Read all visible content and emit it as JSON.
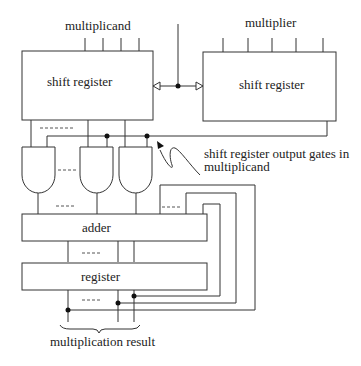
{
  "diagram": {
    "type": "block-diagram",
    "title": "",
    "labels": {
      "multiplicand_input": "multiplicand",
      "multiplier_input": "multiplier",
      "multiplicand_register": "shift register",
      "multiplier_register": "shift register",
      "annotation_line1": "shift register output gates in",
      "annotation_line2": "multiplicand",
      "adder": "adder",
      "register": "register",
      "result": "multiplication result",
      "ellipsis": "----"
    },
    "components": [
      {
        "id": "multiplicand-shift-register",
        "label": "shift register",
        "input": "multiplicand"
      },
      {
        "id": "multiplier-shift-register",
        "label": "shift register",
        "input": "multiplier"
      },
      {
        "id": "and-gates",
        "count_shown": 3,
        "description": "shift register output gates in multiplicand"
      },
      {
        "id": "adder",
        "label": "adder"
      },
      {
        "id": "register",
        "label": "register",
        "output": "multiplication result"
      }
    ],
    "connections": [
      {
        "from": "shift-clock",
        "to": [
          "multiplicand-shift-register",
          "multiplier-shift-register"
        ]
      },
      {
        "from": "multiplicand-shift-register",
        "to": "and-gates"
      },
      {
        "from": "multiplier-shift-register",
        "to": "and-gates",
        "note": "enable line"
      },
      {
        "from": "and-gates",
        "to": "adder"
      },
      {
        "from": "adder",
        "to": "register"
      },
      {
        "from": "register",
        "to": "adder",
        "note": "feedback loops"
      }
    ],
    "colors": {
      "stroke": "#333333",
      "text": "#222222",
      "background": "#ffffff"
    }
  }
}
